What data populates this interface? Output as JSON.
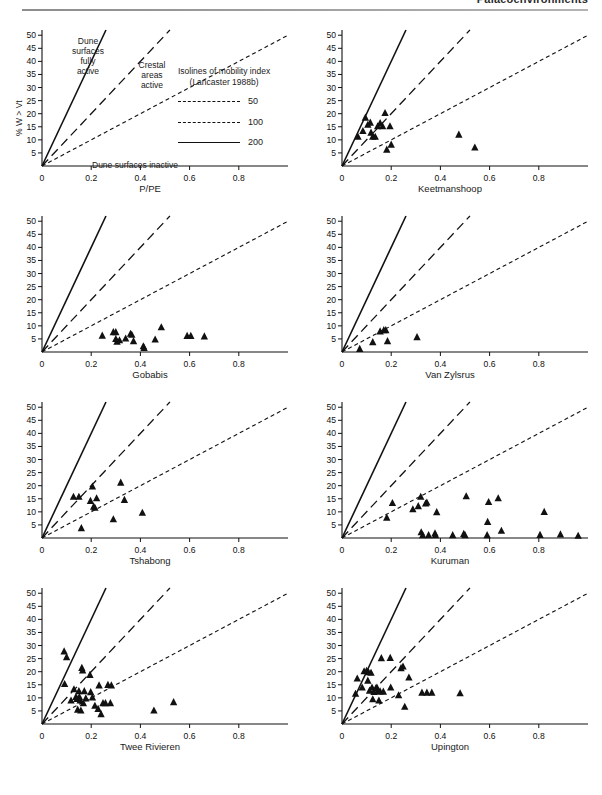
{
  "header": {
    "running_title": "Palaeoenvironments"
  },
  "axes": {
    "x_label": "P/PE",
    "y_label": "% W > Vt",
    "x_ticks": [
      "0",
      "0.2",
      "0.4",
      "0.6",
      "0.8"
    ],
    "x_tick_values": [
      0,
      0.2,
      0.4,
      0.6,
      0.8
    ],
    "y_ticks": [
      "5",
      "10",
      "15",
      "20",
      "25",
      "30",
      "35",
      "40",
      "45",
      "50"
    ],
    "y_tick_values": [
      5,
      10,
      15,
      20,
      25,
      30,
      35,
      40,
      45,
      50
    ],
    "xlim": [
      0,
      1.0
    ],
    "ylim": [
      0,
      52
    ]
  },
  "legend": {
    "title_line1": "Isolines of mobility index",
    "title_line2": "(Lancaster 1988b)",
    "entries": [
      {
        "label": "50",
        "style": "dashed-short"
      },
      {
        "label": "100",
        "style": "dashed-long"
      },
      {
        "label": "200",
        "style": "solid"
      }
    ]
  },
  "annotations": {
    "fully_active": "Dune\nsurfaces\nfully\nactive",
    "fully_active_lines": [
      "Dune",
      "surfaces",
      "fully",
      "active"
    ],
    "crestal_lines": [
      "Crestal",
      "areas",
      "active"
    ],
    "inactive": "Dune surfaces inactive"
  },
  "isolines": {
    "note": "Mobility index M = (%W>Vt) / (P/PE). Lines drawn for M = 50, 100, 200.",
    "values": [
      50,
      100,
      200
    ],
    "styles": [
      "dashed-short",
      "dashed-long",
      "solid"
    ],
    "color": "#111111"
  },
  "marker": {
    "shape": "filled-triangle",
    "color": "#111111"
  },
  "chart_data": [
    {
      "type": "scatter",
      "title": "",
      "panel_index": 0,
      "is_legend_panel": true,
      "xlabel": "P/PE",
      "ylabel": "% W > Vt",
      "xlim": [
        0,
        1.0
      ],
      "ylim": [
        0,
        52
      ],
      "grid": false,
      "points": []
    },
    {
      "type": "scatter",
      "title": "Keetmanshoop",
      "panel_index": 1,
      "xlabel": "Keetmanshoop",
      "ylabel": "% W > Vt",
      "xlim": [
        0,
        1.0
      ],
      "ylim": [
        0,
        52
      ],
      "grid": false,
      "points": [
        [
          0.065,
          11.2
        ],
        [
          0.085,
          13.4
        ],
        [
          0.095,
          18.5
        ],
        [
          0.105,
          15.8
        ],
        [
          0.115,
          16.6
        ],
        [
          0.118,
          12.8
        ],
        [
          0.125,
          11.2
        ],
        [
          0.135,
          11.2
        ],
        [
          0.145,
          15.2
        ],
        [
          0.155,
          16.4
        ],
        [
          0.165,
          15.2
        ],
        [
          0.175,
          20.3
        ],
        [
          0.182,
          6.3
        ],
        [
          0.195,
          15.2
        ],
        [
          0.2,
          8.2
        ],
        [
          0.475,
          12.0
        ],
        [
          0.54,
          7.1
        ]
      ]
    },
    {
      "type": "scatter",
      "title": "Gobabis",
      "panel_index": 2,
      "xlabel": "Gobabis",
      "ylabel": "% W > Vt",
      "xlim": [
        0,
        1.0
      ],
      "ylim": [
        0,
        52
      ],
      "grid": false,
      "points": [
        [
          0.245,
          6.3
        ],
        [
          0.29,
          7.6
        ],
        [
          0.3,
          7.6
        ],
        [
          0.3,
          5.0
        ],
        [
          0.305,
          4.0
        ],
        [
          0.315,
          4.5
        ],
        [
          0.34,
          5.2
        ],
        [
          0.36,
          7.0
        ],
        [
          0.365,
          6.6
        ],
        [
          0.372,
          4.2
        ],
        [
          0.412,
          2.2
        ],
        [
          0.415,
          1.6
        ],
        [
          0.46,
          4.8
        ],
        [
          0.485,
          9.5
        ],
        [
          0.59,
          6.2
        ],
        [
          0.605,
          6.2
        ],
        [
          0.66,
          6.0
        ]
      ]
    },
    {
      "type": "scatter",
      "title": "Van Zylsrus",
      "panel_index": 3,
      "xlabel": "Van Zylsrus",
      "ylabel": "% W > Vt",
      "xlim": [
        0,
        1.0
      ],
      "ylim": [
        0,
        52
      ],
      "grid": false,
      "points": [
        [
          0.072,
          1.2
        ],
        [
          0.125,
          3.8
        ],
        [
          0.155,
          7.9
        ],
        [
          0.17,
          8.4
        ],
        [
          0.178,
          8.4
        ],
        [
          0.185,
          4.2
        ],
        [
          0.305,
          5.7
        ]
      ]
    },
    {
      "type": "scatter",
      "title": "Tshabong",
      "panel_index": 4,
      "xlabel": "Tshabong",
      "ylabel": "% W > Vt",
      "xlim": [
        0,
        1.0
      ],
      "ylim": [
        0,
        52
      ],
      "grid": false,
      "points": [
        [
          0.128,
          15.8
        ],
        [
          0.15,
          15.8
        ],
        [
          0.16,
          3.8
        ],
        [
          0.197,
          14.2
        ],
        [
          0.205,
          19.7
        ],
        [
          0.21,
          12.0
        ],
        [
          0.215,
          11.6
        ],
        [
          0.222,
          15.2
        ],
        [
          0.29,
          7.2
        ],
        [
          0.32,
          21.2
        ],
        [
          0.335,
          14.6
        ],
        [
          0.408,
          9.7
        ]
      ]
    },
    {
      "type": "scatter",
      "title": "Kuruman",
      "panel_index": 5,
      "xlabel": "Kuruman",
      "ylabel": "% W > Vt",
      "xlim": [
        0,
        1.0
      ],
      "ylim": [
        0,
        52
      ],
      "grid": false,
      "points": [
        [
          0.182,
          7.8
        ],
        [
          0.205,
          13.4
        ],
        [
          0.288,
          11.0
        ],
        [
          0.31,
          12.2
        ],
        [
          0.32,
          15.8
        ],
        [
          0.322,
          2.2
        ],
        [
          0.328,
          1.1
        ],
        [
          0.34,
          13.2
        ],
        [
          0.345,
          13.6
        ],
        [
          0.352,
          1.1
        ],
        [
          0.378,
          1.8
        ],
        [
          0.38,
          1.1
        ],
        [
          0.385,
          9.9
        ],
        [
          0.45,
          1.1
        ],
        [
          0.495,
          1.6
        ],
        [
          0.5,
          1.1
        ],
        [
          0.505,
          16.0
        ],
        [
          0.59,
          1.1
        ],
        [
          0.592,
          6.2
        ],
        [
          0.596,
          13.8
        ],
        [
          0.635,
          15.2
        ],
        [
          0.648,
          2.8
        ],
        [
          0.805,
          1.2
        ],
        [
          0.822,
          10.0
        ],
        [
          0.888,
          1.4
        ],
        [
          0.96,
          0.9
        ]
      ]
    },
    {
      "type": "scatter",
      "title": "Twee Rivieren",
      "panel_index": 6,
      "xlabel": "Twee Rivieren",
      "ylabel": "% W > Vt",
      "xlim": [
        0,
        1.0
      ],
      "ylim": [
        0,
        52
      ],
      "grid": false,
      "points": [
        [
          0.09,
          27.8
        ],
        [
          0.1,
          25.6
        ],
        [
          0.092,
          15.3
        ],
        [
          0.118,
          9.0
        ],
        [
          0.13,
          13.3
        ],
        [
          0.138,
          10.4
        ],
        [
          0.142,
          9.6
        ],
        [
          0.145,
          5.5
        ],
        [
          0.15,
          12.6
        ],
        [
          0.152,
          10.4
        ],
        [
          0.155,
          9.0
        ],
        [
          0.158,
          5.2
        ],
        [
          0.162,
          21.5
        ],
        [
          0.165,
          20.5
        ],
        [
          0.168,
          8.0
        ],
        [
          0.172,
          12.6
        ],
        [
          0.178,
          9.8
        ],
        [
          0.195,
          18.8
        ],
        [
          0.198,
          12.2
        ],
        [
          0.205,
          10.2
        ],
        [
          0.215,
          7.0
        ],
        [
          0.228,
          5.8
        ],
        [
          0.232,
          14.8
        ],
        [
          0.24,
          3.8
        ],
        [
          0.248,
          8.0
        ],
        [
          0.258,
          8.0
        ],
        [
          0.268,
          15.0
        ],
        [
          0.278,
          8.0
        ],
        [
          0.282,
          14.8
        ],
        [
          0.455,
          5.2
        ],
        [
          0.535,
          8.4
        ]
      ]
    },
    {
      "type": "scatter",
      "title": "Upington",
      "panel_index": 7,
      "xlabel": "Upington",
      "ylabel": "% W > Vt",
      "xlim": [
        0,
        1.0
      ],
      "ylim": [
        0,
        52
      ],
      "grid": false,
      "points": [
        [
          0.055,
          11.6
        ],
        [
          0.062,
          17.4
        ],
        [
          0.082,
          14.0
        ],
        [
          0.09,
          20.2
        ],
        [
          0.1,
          20.4
        ],
        [
          0.105,
          16.6
        ],
        [
          0.108,
          19.8
        ],
        [
          0.112,
          12.8
        ],
        [
          0.118,
          19.6
        ],
        [
          0.122,
          14.0
        ],
        [
          0.125,
          9.5
        ],
        [
          0.13,
          12.3
        ],
        [
          0.138,
          13.8
        ],
        [
          0.142,
          14.0
        ],
        [
          0.146,
          12.5
        ],
        [
          0.15,
          9.0
        ],
        [
          0.155,
          12.5
        ],
        [
          0.16,
          25.2
        ],
        [
          0.168,
          12.4
        ],
        [
          0.196,
          25.3
        ],
        [
          0.198,
          14.0
        ],
        [
          0.23,
          11.0
        ],
        [
          0.24,
          21.4
        ],
        [
          0.248,
          22.0
        ],
        [
          0.255,
          6.6
        ],
        [
          0.272,
          17.8
        ],
        [
          0.325,
          12.0
        ],
        [
          0.345,
          12.0
        ],
        [
          0.365,
          12.0
        ],
        [
          0.48,
          11.8
        ]
      ]
    }
  ]
}
